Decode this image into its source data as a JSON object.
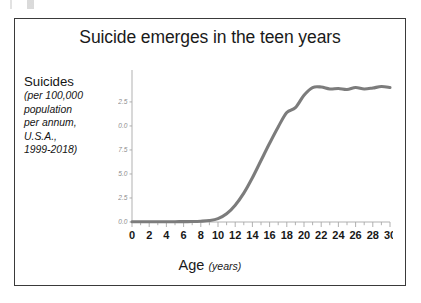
{
  "figure": {
    "title": "Suicide emerges in the teen years",
    "y_caption_main": "Suicides",
    "y_caption_lines": [
      "(per 100,000",
      "population",
      "per annum,",
      "U.S.A.,",
      "1999-2018)"
    ],
    "x_title": "Age",
    "x_title_unit": "(years)",
    "line_color": "#7c7c7c",
    "axis_color": "#a8a8a8",
    "frame_color": "#3a3a3a",
    "title_color": "#1a1a1a"
  },
  "chart_data": {
    "type": "line",
    "title": "Suicide emerges in the teen years",
    "xlabel": "Age (years)",
    "ylabel": "Suicides (per 100,000 population per annum, U.S.A., 1999-2018)",
    "xlim": [
      0,
      30
    ],
    "ylim": [
      0,
      15.2
    ],
    "grid": false,
    "legend": false,
    "x_ticks": [
      0,
      2,
      4,
      6,
      8,
      10,
      12,
      14,
      16,
      18,
      20,
      22,
      24,
      26,
      28,
      30
    ],
    "x_tick_labels": [
      "0",
      "2",
      "4",
      "6",
      "8",
      "10",
      "12",
      "14",
      "16",
      "18",
      "20",
      "22",
      "24",
      "26",
      "28",
      "30"
    ],
    "x_minor_tick_step": 1,
    "y_ticks": [
      0.0,
      2.5,
      5.0,
      7.5,
      10.0,
      12.5
    ],
    "y_tick_labels": [
      "0.0",
      "2.5",
      "5.0",
      "7.5",
      "10.0",
      "12.5"
    ],
    "series": [
      {
        "name": "Suicides per 100,000 per annum",
        "color": "#7c7c7c",
        "x": [
          0,
          1,
          2,
          3,
          4,
          5,
          6,
          7,
          8,
          9,
          10,
          11,
          12,
          13,
          14,
          15,
          16,
          17,
          18,
          19,
          20,
          21,
          22,
          23,
          24,
          25,
          26,
          27,
          28,
          29,
          30
        ],
        "values": [
          0.02,
          0.02,
          0.02,
          0.02,
          0.03,
          0.03,
          0.04,
          0.05,
          0.08,
          0.15,
          0.35,
          0.85,
          1.75,
          3.0,
          4.6,
          6.4,
          8.2,
          9.9,
          11.4,
          11.9,
          13.2,
          14.0,
          14.05,
          13.85,
          13.9,
          13.8,
          14.0,
          13.85,
          13.95,
          14.1,
          14.0
        ]
      }
    ],
    "annotations": []
  }
}
